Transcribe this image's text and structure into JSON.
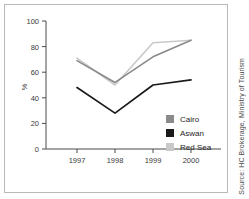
{
  "source": {
    "text": "Source: HC Brokerage, Ministry of Tourism"
  },
  "legend": {
    "items": [
      {
        "label": "Cairo",
        "color": "#8a8a8a"
      },
      {
        "label": "Aswan",
        "color": "#1a1a1a"
      },
      {
        "label": "Red Sea",
        "color": "#c9c9c9"
      }
    ]
  },
  "axis": {
    "y_label": "%",
    "y_ticks": [
      "0",
      "20",
      "40",
      "60",
      "80",
      "100"
    ],
    "x_ticks": [
      "1997",
      "1998",
      "1999",
      "2000"
    ]
  },
  "chart_data": {
    "type": "line",
    "title": "",
    "xlabel": "",
    "ylabel": "%",
    "categories": [
      "1997",
      "1998",
      "1999",
      "2000"
    ],
    "x": [
      1997,
      1998,
      1999,
      2000
    ],
    "ylim": [
      0,
      100
    ],
    "xlim": [
      1996.5,
      2000.5
    ],
    "yticks": [
      0,
      20,
      40,
      60,
      80,
      100
    ],
    "grid": false,
    "legend_position": "inside-right",
    "series": [
      {
        "name": "Cairo",
        "color": "#8a8a8a",
        "values": [
          69,
          52,
          72,
          85
        ]
      },
      {
        "name": "Aswan",
        "color": "#1a1a1a",
        "values": [
          48,
          28,
          50,
          54
        ]
      },
      {
        "name": "Red Sea",
        "color": "#c9c9c9",
        "values": [
          71,
          50,
          83,
          85
        ]
      }
    ]
  }
}
